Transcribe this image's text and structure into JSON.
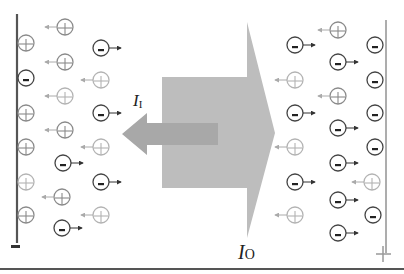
{
  "diagram": {
    "colors": {
      "background": "#ffffff",
      "electrode": "#555555",
      "electrode_right": "#999999",
      "outer_arrow": "#bdbdbd",
      "inner_arrow": "#a8a8a8",
      "anion": "#444444",
      "cation": "#8a8a8a",
      "cation_light": "#b0b0b0",
      "rule": "#555555"
    },
    "labels": {
      "inner_current": {
        "main": "I",
        "sub": "I",
        "x": 133,
        "y": 106
      },
      "outer_current": {
        "main": "I",
        "sub": "O",
        "x": 238,
        "y": 259
      },
      "left_electrode_sign": "−",
      "right_electrode_sign": "+"
    },
    "electrodes": {
      "left": {
        "x": 17,
        "y1": 14,
        "y2": 243,
        "sign": "minus"
      },
      "right": {
        "x": 386,
        "y1": 20,
        "y2": 253,
        "sign": "plus"
      }
    },
    "arrows": {
      "outer": {
        "label": "I_O",
        "direction": "right",
        "body": [
          162,
          77,
          247,
          188
        ],
        "head_top": 22,
        "head_bottom": 238,
        "tip": [
          275,
          133
        ]
      },
      "inner": {
        "label": "I_I",
        "direction": "left",
        "shaft": [
          147,
          123,
          218,
          145
        ],
        "head_top": 113,
        "head_bottom": 155,
        "tip": [
          122,
          134
        ]
      }
    },
    "ions": [
      {
        "type": "cation",
        "x": 26,
        "y": 43,
        "arrow": false,
        "shade": "dark"
      },
      {
        "type": "anion",
        "x": 26,
        "y": 78,
        "arrow": false
      },
      {
        "type": "cation",
        "x": 26,
        "y": 113,
        "arrow": false,
        "shade": "dark"
      },
      {
        "type": "cation",
        "x": 26,
        "y": 147,
        "arrow": false,
        "shade": "dark"
      },
      {
        "type": "cation",
        "x": 26,
        "y": 182,
        "arrow": false,
        "shade": "light"
      },
      {
        "type": "cation",
        "x": 26,
        "y": 215,
        "arrow": false,
        "shade": "dark"
      },
      {
        "type": "cation",
        "x": 65,
        "y": 27,
        "arrow": true,
        "shade": "dark"
      },
      {
        "type": "cation",
        "x": 65,
        "y": 62,
        "arrow": true,
        "shade": "dark"
      },
      {
        "type": "cation",
        "x": 65,
        "y": 96,
        "arrow": true,
        "shade": "light"
      },
      {
        "type": "cation",
        "x": 65,
        "y": 130,
        "arrow": true,
        "shade": "dark"
      },
      {
        "type": "anion",
        "x": 63,
        "y": 163,
        "arrow": true
      },
      {
        "type": "cation",
        "x": 62,
        "y": 197,
        "arrow": true,
        "shade": "dark"
      },
      {
        "type": "anion",
        "x": 62,
        "y": 228,
        "arrow": true
      },
      {
        "type": "anion",
        "x": 101,
        "y": 48,
        "arrow": true
      },
      {
        "type": "cation",
        "x": 101,
        "y": 80,
        "arrow": true,
        "shade": "light"
      },
      {
        "type": "anion",
        "x": 101,
        "y": 113,
        "arrow": true
      },
      {
        "type": "cation",
        "x": 101,
        "y": 147,
        "arrow": true,
        "shade": "light"
      },
      {
        "type": "anion",
        "x": 101,
        "y": 182,
        "arrow": true
      },
      {
        "type": "cation",
        "x": 101,
        "y": 215,
        "arrow": true,
        "shade": "light"
      },
      {
        "type": "anion",
        "x": 295,
        "y": 45,
        "arrow": true
      },
      {
        "type": "cation",
        "x": 295,
        "y": 80,
        "arrow": true,
        "shade": "light"
      },
      {
        "type": "anion",
        "x": 295,
        "y": 113,
        "arrow": true
      },
      {
        "type": "cation",
        "x": 295,
        "y": 147,
        "arrow": true,
        "shade": "light"
      },
      {
        "type": "anion",
        "x": 295,
        "y": 182,
        "arrow": true
      },
      {
        "type": "cation",
        "x": 295,
        "y": 215,
        "arrow": true,
        "shade": "light"
      },
      {
        "type": "cation",
        "x": 338,
        "y": 30,
        "arrow": true,
        "shade": "dark"
      },
      {
        "type": "anion",
        "x": 338,
        "y": 62,
        "arrow": true
      },
      {
        "type": "cation",
        "x": 338,
        "y": 96,
        "arrow": true,
        "shade": "dark"
      },
      {
        "type": "anion",
        "x": 338,
        "y": 128,
        "arrow": true
      },
      {
        "type": "anion",
        "x": 338,
        "y": 163,
        "arrow": true
      },
      {
        "type": "anion",
        "x": 338,
        "y": 200,
        "arrow": true
      },
      {
        "type": "anion",
        "x": 338,
        "y": 233,
        "arrow": true
      },
      {
        "type": "anion",
        "x": 375,
        "y": 45,
        "arrow": false
      },
      {
        "type": "anion",
        "x": 375,
        "y": 80,
        "arrow": false
      },
      {
        "type": "anion",
        "x": 375,
        "y": 113,
        "arrow": false
      },
      {
        "type": "anion",
        "x": 375,
        "y": 147,
        "arrow": false
      },
      {
        "type": "cation",
        "x": 372,
        "y": 182,
        "arrow": true,
        "shade": "light"
      },
      {
        "type": "anion",
        "x": 373,
        "y": 215,
        "arrow": false
      }
    ]
  }
}
